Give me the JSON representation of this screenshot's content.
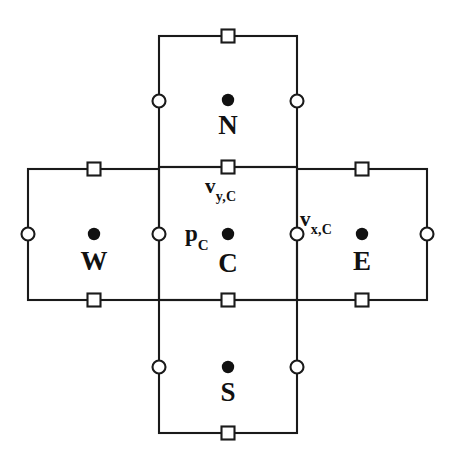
{
  "figure": {
    "background_color": "#ffffff",
    "line_color": "#1a1a1a",
    "marker_fill_color": "#111111",
    "marker_open_fill": "#ffffff",
    "width": 452,
    "height": 462
  },
  "cells": [
    {
      "id": "north",
      "label": "N",
      "x": 159,
      "y": 36,
      "w": 138,
      "h": 131,
      "center_dot": {
        "cx": 228,
        "cy": 100
      },
      "label_pos": {
        "x": 228,
        "y": 112
      }
    },
    {
      "id": "west",
      "label": "W",
      "x": 28,
      "y": 169,
      "w": 131,
      "h": 131,
      "center_dot": {
        "cx": 94,
        "cy": 234
      },
      "label_pos": {
        "x": 94,
        "y": 248
      }
    },
    {
      "id": "center",
      "label": "C",
      "x": 159,
      "y": 167,
      "w": 138,
      "h": 133,
      "center_dot": {
        "cx": 228,
        "cy": 234
      },
      "label_pos": {
        "x": 228,
        "y": 250
      }
    },
    {
      "id": "east",
      "label": "E",
      "x": 297,
      "y": 169,
      "w": 130,
      "h": 131,
      "center_dot": {
        "cx": 362,
        "cy": 234
      },
      "label_pos": {
        "x": 362,
        "y": 248
      }
    },
    {
      "id": "south",
      "label": "S",
      "x": 159,
      "y": 300,
      "w": 138,
      "h": 133,
      "center_dot": {
        "cx": 228,
        "cy": 367
      },
      "label_pos": {
        "x": 228,
        "y": 379
      }
    }
  ],
  "face_markers": {
    "squares": [
      {
        "id": "north-top-face",
        "cx": 228,
        "cy": 36
      },
      {
        "id": "north-bottom-face",
        "cx": 228,
        "cy": 167
      },
      {
        "id": "west-top-face",
        "cx": 94,
        "cy": 169
      },
      {
        "id": "west-bottom-face",
        "cx": 94,
        "cy": 300
      },
      {
        "id": "east-top-face",
        "cx": 362,
        "cy": 169
      },
      {
        "id": "east-bottom-face",
        "cx": 362,
        "cy": 300
      },
      {
        "id": "center-bottom-face",
        "cx": 228,
        "cy": 300
      },
      {
        "id": "south-bottom-face",
        "cx": 228,
        "cy": 433
      }
    ],
    "circles": [
      {
        "id": "north-left-face",
        "cx": 159,
        "cy": 101
      },
      {
        "id": "north-right-face",
        "cx": 297,
        "cy": 101
      },
      {
        "id": "west-left-face",
        "cx": 28,
        "cy": 234
      },
      {
        "id": "center-left-face",
        "cx": 159,
        "cy": 234
      },
      {
        "id": "center-right-face",
        "cx": 297,
        "cy": 234
      },
      {
        "id": "east-right-face",
        "cx": 427,
        "cy": 234
      },
      {
        "id": "south-left-face",
        "cx": 159,
        "cy": 367
      },
      {
        "id": "south-right-face",
        "cx": 297,
        "cy": 367
      }
    ],
    "square_size": 13,
    "circle_radius": 6.5,
    "dot_radius": 6.2
  },
  "variable_labels": [
    {
      "id": "v-y-c",
      "base": "v",
      "sub": "y,C",
      "pos": {
        "left": 205,
        "top": 176
      }
    },
    {
      "id": "v-x-c",
      "base": "v",
      "sub": "x,C",
      "pos": {
        "left": 300,
        "top": 209
      }
    },
    {
      "id": "p-c",
      "base": "p",
      "sub": "C",
      "pos": {
        "left": 185,
        "top": 222
      }
    }
  ],
  "legend_semantics": {
    "filled_dot": "cell-center node (pressure / scalar)",
    "open_square": "horizontal face node (y-velocity)",
    "open_circle": "vertical face node (x-velocity)"
  }
}
